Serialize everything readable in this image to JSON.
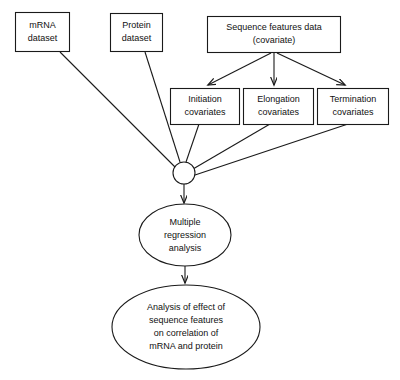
{
  "diagram": {
    "background_color": "#ffffff",
    "line_color": "#1a1a1a",
    "text_color": "#111111",
    "nodes": {
      "mrna_dataset": {
        "shape": "rectangle",
        "line1": "mRNA",
        "line2": "dataset"
      },
      "protein_dataset": {
        "shape": "rectangle",
        "line1": "Protein",
        "line2": "dataset"
      },
      "sequence_features": {
        "shape": "rectangle",
        "line1": "Sequence features data",
        "line2": "(covariate)"
      },
      "initiation_covariates": {
        "shape": "rectangle",
        "line1": "Initiation",
        "line2": "covariates"
      },
      "elongation_covariates": {
        "shape": "rectangle",
        "line1": "Elongation",
        "line2": "covariates"
      },
      "termination_covariates": {
        "shape": "rectangle",
        "line1": "Termination",
        "line2": "covariates"
      },
      "junction": {
        "shape": "circle",
        "label": ""
      },
      "multiple_regression": {
        "shape": "ellipse",
        "line1": "Multiple",
        "line2": "regression",
        "line3": "analysis"
      },
      "analysis_result": {
        "shape": "ellipse",
        "line1": "Analysis of effect of",
        "line2": "sequence features",
        "line3": "on correlation of",
        "line4": "mRNA and protein"
      }
    },
    "edges": [
      {
        "from": "sequence_features",
        "to": "initiation_covariates",
        "arrow": true
      },
      {
        "from": "sequence_features",
        "to": "elongation_covariates",
        "arrow": true
      },
      {
        "from": "sequence_features",
        "to": "termination_covariates",
        "arrow": true
      },
      {
        "from": "mrna_dataset",
        "to": "junction",
        "arrow": false
      },
      {
        "from": "protein_dataset",
        "to": "junction",
        "arrow": false
      },
      {
        "from": "initiation_covariates",
        "to": "junction",
        "arrow": false
      },
      {
        "from": "elongation_covariates",
        "to": "junction",
        "arrow": false
      },
      {
        "from": "termination_covariates",
        "to": "junction",
        "arrow": false
      },
      {
        "from": "junction",
        "to": "multiple_regression",
        "arrow": true
      },
      {
        "from": "multiple_regression",
        "to": "analysis_result",
        "arrow": true
      }
    ]
  }
}
